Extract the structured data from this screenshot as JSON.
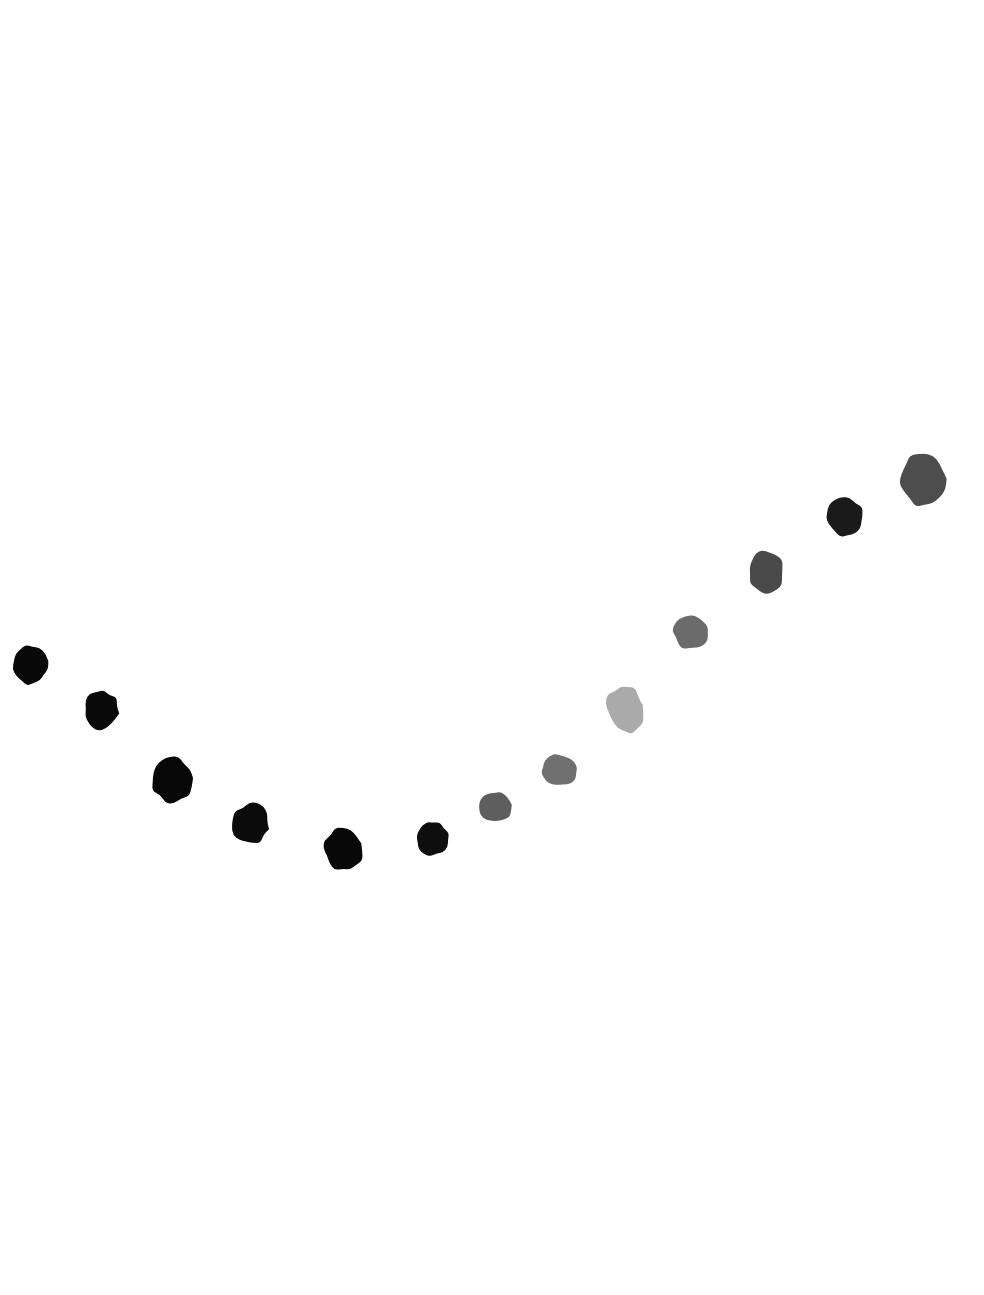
{
  "figure": {
    "background_color": "#ffffff",
    "width": 984,
    "height": 1295
  },
  "chart_data": {
    "type": "scatter",
    "title": "",
    "subtitle": "",
    "xlabel": "",
    "ylabel": "",
    "legend": [],
    "legend_position": "none",
    "grid": false,
    "axes_visible": false,
    "tick_labels_x": [],
    "tick_labels_y": [],
    "xlim": [
      0,
      984
    ],
    "ylim": [
      1295,
      0
    ],
    "marker_style": "hand-painted irregular blob",
    "points": [
      {
        "index": 1,
        "x": 30,
        "y": 665,
        "radius_x": 18,
        "radius_y": 21,
        "color": "#080808",
        "rotation": -12
      },
      {
        "index": 2,
        "x": 101,
        "y": 711,
        "radius_x": 18,
        "radius_y": 21,
        "color": "#0a0a0a",
        "rotation": 8
      },
      {
        "index": 3,
        "x": 172,
        "y": 780,
        "radius_x": 21,
        "radius_y": 23,
        "color": "#070707",
        "rotation": -5
      },
      {
        "index": 4,
        "x": 251,
        "y": 824,
        "radius_x": 19,
        "radius_y": 21,
        "color": "#0b0b0b",
        "rotation": 16
      },
      {
        "index": 5,
        "x": 343,
        "y": 850,
        "radius_x": 20,
        "radius_y": 22,
        "color": "#080808",
        "rotation": -20
      },
      {
        "index": 6,
        "x": 432,
        "y": 838,
        "radius_x": 17,
        "radius_y": 18,
        "color": "#0e0e0e",
        "rotation": 6
      },
      {
        "index": 7,
        "x": 496,
        "y": 807,
        "radius_x": 17,
        "radius_y": 16,
        "color": "#5e5e5e",
        "rotation": -8
      },
      {
        "index": 8,
        "x": 559,
        "y": 770,
        "radius_x": 19,
        "radius_y": 16,
        "color": "#707070",
        "rotation": 11
      },
      {
        "index": 9,
        "x": 626,
        "y": 709,
        "radius_x": 19,
        "radius_y": 25,
        "color": "#ababab",
        "rotation": -14
      },
      {
        "index": 10,
        "x": 691,
        "y": 632,
        "radius_x": 19,
        "radius_y": 18,
        "color": "#6b6b6b",
        "rotation": 4
      },
      {
        "index": 11,
        "x": 766,
        "y": 572,
        "radius_x": 19,
        "radius_y": 23,
        "color": "#4a4a4a",
        "rotation": -9
      },
      {
        "index": 12,
        "x": 845,
        "y": 517,
        "radius_x": 20,
        "radius_y": 20,
        "color": "#1a1a1a",
        "rotation": 14
      },
      {
        "index": 13,
        "x": 922,
        "y": 481,
        "radius_x": 23,
        "radius_y": 27,
        "color": "#4d4d4d",
        "rotation": -6
      }
    ]
  }
}
